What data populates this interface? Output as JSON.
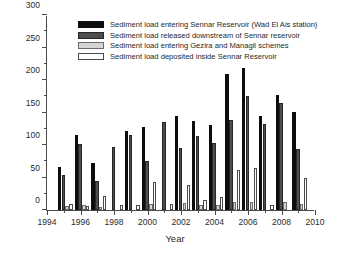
{
  "chart_data": {
    "type": "bar",
    "title": "",
    "xlabel": "Year",
    "ylabel": "Sediment load (million ton/year)",
    "xlim": [
      1994,
      2010
    ],
    "ylim": [
      0,
      300
    ],
    "ytick_step": 50,
    "yticks": [
      0,
      50,
      100,
      150,
      200,
      250,
      300
    ],
    "xticks": [
      1994,
      1996,
      1998,
      2000,
      2002,
      2004,
      2006,
      2008,
      2010
    ],
    "xtick_labels": [
      "1994",
      "1996",
      "1998",
      "2000",
      "2002",
      "2004",
      "2006",
      "2008",
      "2010"
    ],
    "xtick_minor": [
      1995,
      1997,
      1999,
      2001,
      2003,
      2005,
      2007,
      2009
    ],
    "grid": false,
    "legend_position": "top-center",
    "categories": [
      1995,
      1996,
      1997,
      1998,
      1999,
      2000,
      2001,
      2002,
      2003,
      2004,
      2005,
      2006,
      2007,
      2008,
      2009
    ],
    "series": [
      {
        "name": "Sediment load entering Sennar Reservoir (Wad El Ais station)",
        "color": "#0d0d0d",
        "values": [
          66,
          115,
          72,
          null,
          122,
          128,
          null,
          145,
          137,
          131,
          210,
          219,
          144,
          177,
          151
        ]
      },
      {
        "name": "Sediment load released downstream of Sennar reservoir",
        "color": "#4d4d4d",
        "values": [
          54,
          102,
          44,
          97,
          115,
          76,
          135,
          96,
          114,
          103,
          138,
          176,
          132,
          164,
          94
        ]
      },
      {
        "name": "Sediment load entering Gezira and Managil schemes",
        "color": "#d4d4d4",
        "values": [
          6,
          7,
          5,
          null,
          null,
          10,
          null,
          11,
          7,
          8,
          12,
          12,
          null,
          12,
          9
        ]
      },
      {
        "name": "Sediment load deposited inside Sennar Reservoir",
        "color": "#ffffff",
        "values": [
          9,
          6,
          22,
          7,
          8,
          43,
          10,
          39,
          16,
          20,
          62,
          65,
          7,
          null,
          50
        ]
      }
    ]
  },
  "legend": {
    "items": [
      {
        "label": "Sediment load entering Sennar Reservoir (Wad El Ais station)",
        "swatch": "s0"
      },
      {
        "label": "Sediment load released downstream of Sennar reservoir",
        "swatch": "s1"
      },
      {
        "label": "Sediment load entering Gezira and Managil schemes",
        "swatch": "s2"
      },
      {
        "label": "Sediment load deposited inside Sennar Reservoir",
        "swatch": "s3"
      }
    ]
  },
  "axes": {
    "x_title": "Year",
    "y_title": "Sediment load (million ton/year)"
  },
  "caption_remnant": ""
}
